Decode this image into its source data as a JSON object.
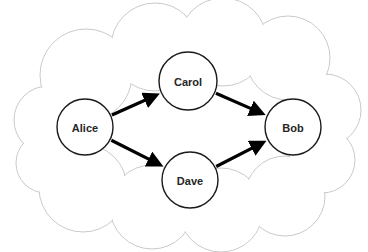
{
  "diagram": {
    "type": "network-graph",
    "title": "",
    "canvas": {
      "width": 368,
      "height": 252,
      "background": "#ffffff"
    },
    "container": {
      "shape": "cloud",
      "label": "",
      "stroke_color": "#c9c9c9",
      "fill_color": "#ffffff",
      "puffs": [
        {
          "cx": 48,
          "cy": 120,
          "r": 34
        },
        {
          "cx": 46,
          "cy": 163,
          "r": 30
        },
        {
          "cx": 86,
          "cy": 75,
          "r": 46
        },
        {
          "cx": 83,
          "cy": 188,
          "r": 44
        },
        {
          "cx": 155,
          "cy": 47,
          "r": 44
        },
        {
          "cx": 152,
          "cy": 207,
          "r": 42
        },
        {
          "cx": 223,
          "cy": 42,
          "r": 44
        },
        {
          "cx": 221,
          "cy": 210,
          "r": 42
        },
        {
          "cx": 288,
          "cy": 58,
          "r": 42
        },
        {
          "cx": 285,
          "cy": 196,
          "r": 40
        },
        {
          "cx": 325,
          "cy": 110,
          "r": 36
        },
        {
          "cx": 322,
          "cy": 160,
          "r": 33
        }
      ]
    },
    "nodes": [
      {
        "id": "alice",
        "label": "Alice",
        "cx": 85,
        "cy": 127,
        "r": 28
      },
      {
        "id": "carol",
        "label": "Carol",
        "cx": 188,
        "cy": 81,
        "r": 29
      },
      {
        "id": "dave",
        "label": "Dave",
        "cx": 190,
        "cy": 180,
        "r": 28
      },
      {
        "id": "bob",
        "label": "Bob",
        "cx": 293,
        "cy": 127,
        "r": 28
      }
    ],
    "edges": [
      {
        "id": "alice-carol",
        "from": "alice",
        "to": "carol",
        "label": "",
        "directed": true,
        "color": "#000000"
      },
      {
        "id": "carol-bob",
        "from": "carol",
        "to": "bob",
        "label": "",
        "directed": true,
        "color": "#000000"
      },
      {
        "id": "alice-dave",
        "from": "alice",
        "to": "dave",
        "label": "",
        "directed": true,
        "color": "#000000"
      },
      {
        "id": "dave-bob",
        "from": "dave",
        "to": "bob",
        "label": "",
        "directed": true,
        "color": "#000000"
      }
    ]
  }
}
